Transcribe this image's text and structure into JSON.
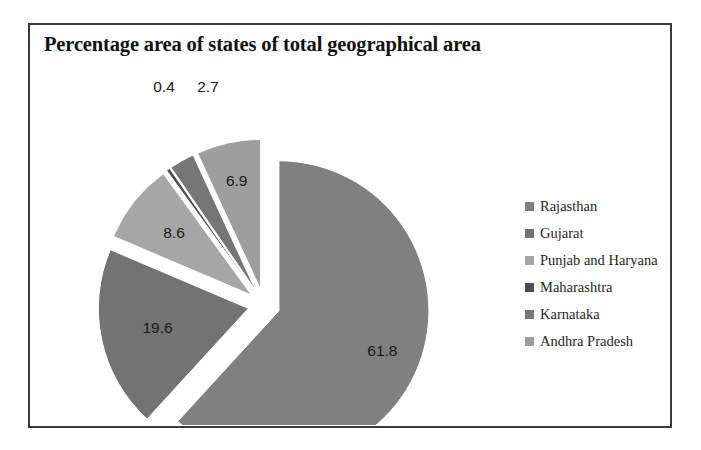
{
  "chart_data": {
    "type": "pie",
    "title": "Percentage area of states of total geographical area",
    "xlabel": "",
    "ylabel": "",
    "legend_position": "right",
    "grid": false,
    "exploded": true,
    "units": "percent",
    "categories": [
      "Rajasthan",
      "Gujarat",
      "Punjab and Haryana",
      "Maharashtra",
      "Karnataka",
      "Andhra Pradesh"
    ],
    "values": [
      61.8,
      19.6,
      8.6,
      0.4,
      2.7,
      6.9
    ],
    "labels": [
      "61.8",
      "19.6",
      "8.6",
      "0.4",
      "2.7",
      "6.9"
    ],
    "colors": [
      "#808080",
      "#737373",
      "#a6a6a6",
      "#4d4d4d",
      "#767676",
      "#9e9e9e"
    ],
    "slices": [
      {
        "name": "Rajasthan",
        "value": 61.8,
        "label": "61.8",
        "color": "#808080"
      },
      {
        "name": "Gujarat",
        "value": 19.6,
        "label": "19.6",
        "color": "#737373"
      },
      {
        "name": "Punjab and Haryana",
        "value": 8.6,
        "label": "8.6",
        "color": "#a6a6a6"
      },
      {
        "name": "Maharashtra",
        "value": 0.4,
        "label": "0.4",
        "color": "#4d4d4d"
      },
      {
        "name": "Karnataka",
        "value": 2.7,
        "label": "2.7",
        "color": "#767676"
      },
      {
        "name": "Andhra Pradesh",
        "value": 6.9,
        "label": "6.9",
        "color": "#9e9e9e"
      }
    ]
  },
  "title": {
    "text": "Percentage area of states of total geographical area"
  },
  "legend": {
    "items": [
      {
        "label": "Rajasthan",
        "color": "#808080"
      },
      {
        "label": "Gujarat",
        "color": "#737373"
      },
      {
        "label": "Punjab and Haryana",
        "color": "#a6a6a6"
      },
      {
        "label": "Maharashtra",
        "color": "#4d4d4d"
      },
      {
        "label": "Karnataka",
        "color": "#767676"
      },
      {
        "label": "Andhra Pradesh",
        "color": "#9e9e9e"
      }
    ]
  },
  "data_labels": {
    "rajasthan": "61.8",
    "gujarat": "19.6",
    "punjab_and_haryana": "8.6",
    "maharashtra": "0.4",
    "karnataka": "2.7",
    "andhra_pradesh": "6.9"
  },
  "style": {
    "frame_color": "#3a3a3a",
    "background": "#ffffff",
    "label_color": "#1a1a1a"
  }
}
